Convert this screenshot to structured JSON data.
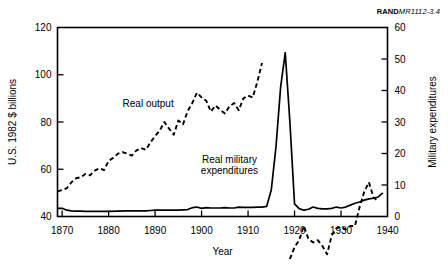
{
  "report_code": {
    "bold": "RAND",
    "italic": "MR1112-3.4"
  },
  "chart_data": {
    "type": "line",
    "title": "",
    "xlabel": "Year",
    "ylabel": "U.S. 1982 $ billions",
    "y2label": "Military expenditures",
    "xlim": [
      1869,
      1940
    ],
    "ylim": [
      40,
      120
    ],
    "y2lim": [
      0,
      60
    ],
    "xticks": [
      1870,
      1880,
      1890,
      1900,
      1910,
      1920,
      1930,
      1940
    ],
    "xticklabels": [
      "1870",
      "1880",
      "1890",
      "1900",
      "1910",
      "1920",
      "1930",
      "1940"
    ],
    "yticks": [
      40,
      60,
      80,
      100,
      120
    ],
    "yticklabels": [
      "40",
      "60",
      "80",
      "100",
      "120"
    ],
    "y2ticks": [
      0,
      10,
      20,
      30,
      40,
      50,
      60
    ],
    "y2ticklabels": [
      "0",
      "10",
      "20",
      "30",
      "40",
      "50",
      "60"
    ],
    "grid": false,
    "legend": "inline-annotations",
    "annotations": [
      {
        "text": "Real output",
        "x": 1888.5,
        "y": 86.5,
        "axis": "left"
      },
      {
        "text": "Real military",
        "x": 1906.0,
        "y": 62.5,
        "axis": "left"
      },
      {
        "text": "expenditures",
        "x": 1906.0,
        "y": 58.2,
        "axis": "left"
      }
    ],
    "series": [
      {
        "name": "Real output",
        "axis": "left",
        "style": "dashed",
        "color": "#000000",
        "unit": "U.S. 1982 $ billions",
        "segments": [
          {
            "x": [
              1869,
              1870,
              1871,
              1872,
              1873,
              1874,
              1875,
              1876,
              1877,
              1878,
              1879,
              1880,
              1881,
              1882,
              1883,
              1884,
              1885,
              1886,
              1887,
              1888,
              1889,
              1890,
              1891,
              1892,
              1893,
              1894,
              1895,
              1896,
              1897,
              1898,
              1899,
              1900,
              1901,
              1902,
              1903,
              1904,
              1905,
              1906,
              1907,
              1908,
              1909,
              1910,
              1911,
              1912,
              1913
            ],
            "y": [
              50.6,
              51.2,
              52.0,
              54.5,
              56.2,
              56.6,
              58.0,
              57.4,
              59.4,
              60.4,
              59.6,
              63.6,
              64.8,
              66.6,
              67.2,
              66.6,
              65.8,
              68.0,
              69.0,
              68.2,
              71.4,
              74.0,
              76.4,
              80.0,
              77.2,
              74.6,
              80.6,
              79.0,
              84.6,
              88.0,
              92.4,
              90.4,
              89.0,
              84.4,
              87.0,
              85.2,
              83.6,
              86.6,
              88.0,
              85.0,
              90.0,
              91.2,
              90.4,
              97.0,
              105.0
            ]
          },
          {
            "x": [
              1919,
              1920,
              1921,
              1922,
              1923,
              1924,
              1925,
              1926,
              1927,
              1928,
              1929,
              1930,
              1931,
              1932,
              1933,
              1934,
              1935,
              1936,
              1937,
              1938
            ],
            "y": [
              22.0,
              27.0,
              30.0,
              36.0,
              30.5,
              29.0,
              30.0,
              27.5,
              24.0,
              32.0,
              35.0,
              35.5,
              34.5,
              36.0,
              36.0,
              44.0,
              50.5,
              54.5,
              48.0,
              46.5
            ]
          }
        ]
      },
      {
        "name": "Real military expenditures",
        "axis": "right",
        "style": "solid",
        "color": "#000000",
        "unit": "Military expenditures",
        "segments": [
          {
            "x": [
              1869,
              1870,
              1871,
              1872,
              1873,
              1874,
              1875,
              1876,
              1877,
              1878,
              1880,
              1882,
              1884,
              1886,
              1888,
              1889,
              1890,
              1891,
              1892,
              1893,
              1894,
              1895,
              1896,
              1897,
              1898,
              1899,
              1900,
              1901,
              1902,
              1903,
              1904,
              1905,
              1906,
              1907,
              1908,
              1909,
              1910,
              1911,
              1912,
              1913,
              1914,
              1915,
              1916,
              1917,
              1918,
              1919,
              1920,
              1921,
              1922,
              1923,
              1924,
              1925,
              1926,
              1927,
              1928,
              1929,
              1930,
              1931,
              1932,
              1933,
              1934,
              1935,
              1936,
              1937,
              1938,
              1939
            ],
            "y": [
              2.6,
              2.6,
              2.0,
              1.8,
              1.7,
              1.7,
              1.6,
              1.6,
              1.6,
              1.6,
              1.6,
              1.7,
              1.8,
              1.8,
              1.8,
              1.9,
              2.0,
              2.0,
              2.0,
              2.0,
              2.0,
              2.0,
              2.1,
              2.2,
              2.8,
              3.0,
              2.6,
              2.8,
              2.7,
              2.7,
              2.7,
              2.8,
              2.7,
              2.7,
              3.0,
              2.9,
              2.9,
              2.9,
              3.0,
              3.0,
              3.2,
              8.5,
              22.0,
              41.0,
              52.0,
              30.0,
              4.0,
              2.5,
              2.0,
              2.3,
              3.0,
              2.6,
              2.4,
              2.4,
              2.6,
              3.0,
              2.7,
              3.0,
              3.6,
              4.2,
              4.6,
              5.2,
              5.6,
              5.8,
              6.2,
              7.5
            ]
          }
        ]
      }
    ]
  }
}
